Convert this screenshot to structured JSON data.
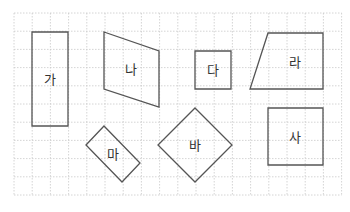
{
  "grid": {
    "x0": 14,
    "y0": 13,
    "cols": 18,
    "rows": 10,
    "cell": 18.2,
    "color": "#c9c9c9"
  },
  "shapes": [
    {
      "label": "가",
      "points": "32,32 68,32 68,126 32,126",
      "lx": 50,
      "ly": 80
    },
    {
      "label": "나",
      "points": "104,32 159,51 159,107 104,89",
      "lx": 131,
      "ly": 70
    },
    {
      "label": "다",
      "points": "195,51 231,51 231,89 195,89",
      "lx": 213,
      "ly": 71
    },
    {
      "label": "라",
      "points": "268,33 323,33 323,89 250,89",
      "lx": 295,
      "ly": 63
    },
    {
      "label": "마",
      "points": "86,145 104,126 140,163 122,182",
      "lx": 113,
      "ly": 155
    },
    {
      "label": "바",
      "points": "195,108 232,145 195,182 158,145",
      "lx": 195,
      "ly": 146
    },
    {
      "label": "사",
      "points": "268,108 323,108 323,165 268,165",
      "lx": 295,
      "ly": 138
    }
  ],
  "stroke_color": "#555555"
}
